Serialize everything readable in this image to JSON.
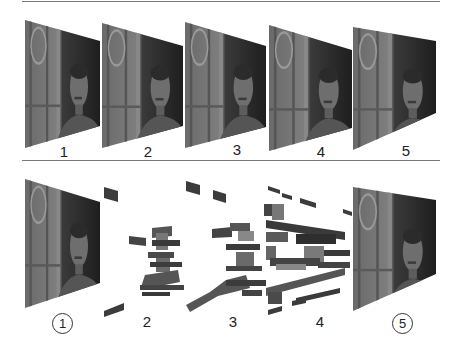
{
  "figure": {
    "top_row": {
      "description": "Full decoded video frames in sequence",
      "frames": [
        {
          "label": "1"
        },
        {
          "label": "2"
        },
        {
          "label": "3"
        },
        {
          "label": "4"
        },
        {
          "label": "5"
        }
      ]
    },
    "bottom_row": {
      "description": "Reference (key) frames 1 and 5 complete; intermediate frames 2-4 shown as partial block fragments",
      "frames": [
        {
          "label": "1",
          "circled": true,
          "type": "full"
        },
        {
          "label": "2",
          "circled": false,
          "type": "fragments"
        },
        {
          "label": "3",
          "circled": false,
          "type": "fragments"
        },
        {
          "label": "4",
          "circled": false,
          "type": "fragments"
        },
        {
          "label": "5",
          "circled": true,
          "type": "full"
        }
      ]
    },
    "colors": {
      "frame_dark": "#2a2a2a",
      "frame_mid": "#5a5a5a",
      "wall_light": "#7c7c7c",
      "rule": "#7a7a7a",
      "text": "#222222"
    }
  }
}
